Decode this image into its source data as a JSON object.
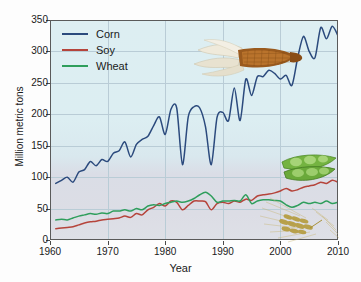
{
  "chart_data": {
    "type": "line",
    "title": "",
    "xlabel": "Year",
    "ylabel": "Million metric tons",
    "xlim": [
      1960,
      2010
    ],
    "ylim": [
      0,
      350
    ],
    "xticks": [
      1960,
      1970,
      1980,
      1990,
      2000,
      2010
    ],
    "yticks": [
      0,
      50,
      100,
      150,
      200,
      250,
      300,
      350
    ],
    "grid": true,
    "legend_position": "top-left",
    "x": [
      1961,
      1962,
      1963,
      1964,
      1965,
      1966,
      1967,
      1968,
      1969,
      1970,
      1971,
      1972,
      1973,
      1974,
      1975,
      1976,
      1977,
      1978,
      1979,
      1980,
      1981,
      1982,
      1983,
      1984,
      1985,
      1986,
      1987,
      1988,
      1989,
      1990,
      1991,
      1992,
      1993,
      1994,
      1995,
      1996,
      1997,
      1998,
      1999,
      2000,
      2001,
      2002,
      2003,
      2004,
      2005,
      2006,
      2007,
      2008,
      2009,
      2010
    ],
    "series": [
      {
        "name": "Corn",
        "color": "#2b4a7d",
        "values": [
          90,
          95,
          100,
          92,
          108,
          112,
          125,
          118,
          128,
          125,
          138,
          142,
          156,
          132,
          152,
          160,
          165,
          182,
          196,
          168,
          208,
          210,
          120,
          196,
          212,
          210,
          180,
          120,
          195,
          203,
          190,
          242,
          190,
          256,
          230,
          260,
          260,
          270,
          265,
          256,
          262,
          246,
          290,
          324,
          300,
          290,
          338,
          320,
          340,
          325
        ]
      },
      {
        "name": "Soy",
        "color": "#b5443b",
        "values": [
          18,
          19,
          20,
          21,
          24,
          27,
          29,
          30,
          32,
          33,
          34,
          35,
          38,
          36,
          42,
          40,
          48,
          52,
          58,
          54,
          62,
          60,
          48,
          55,
          62,
          62,
          61,
          48,
          58,
          60,
          58,
          62,
          60,
          65,
          63,
          70,
          72,
          73,
          75,
          78,
          82,
          78,
          80,
          84,
          86,
          88,
          92,
          90,
          95,
          92
        ]
      },
      {
        "name": "Wheat",
        "color": "#2f9e5c",
        "values": [
          32,
          33,
          32,
          35,
          38,
          40,
          42,
          41,
          43,
          42,
          46,
          46,
          48,
          46,
          50,
          48,
          54,
          56,
          55,
          58,
          60,
          62,
          60,
          62,
          66,
          72,
          76,
          70,
          60,
          62,
          62,
          63,
          62,
          72,
          58,
          62,
          64,
          64,
          63,
          62,
          56,
          52,
          55,
          60,
          58,
          60,
          58,
          62,
          58,
          60
        ]
      }
    ]
  },
  "legend": {
    "items": [
      {
        "label": "Corn",
        "color": "#2b4a7d"
      },
      {
        "label": "Soy",
        "color": "#b5443b"
      },
      {
        "label": "Wheat",
        "color": "#2f9e5c"
      }
    ]
  },
  "illustrations": [
    {
      "name": "corn-cob-illustration",
      "subject": "Corn"
    },
    {
      "name": "soybean-pod-illustration",
      "subject": "Soy"
    },
    {
      "name": "wheat-stalk-illustration",
      "subject": "Wheat"
    }
  ],
  "colors": {
    "plot_background": "#dceef2",
    "grid": "#b9ccd6",
    "axis": "#4a4a4a",
    "text": "#1a1a1a"
  }
}
